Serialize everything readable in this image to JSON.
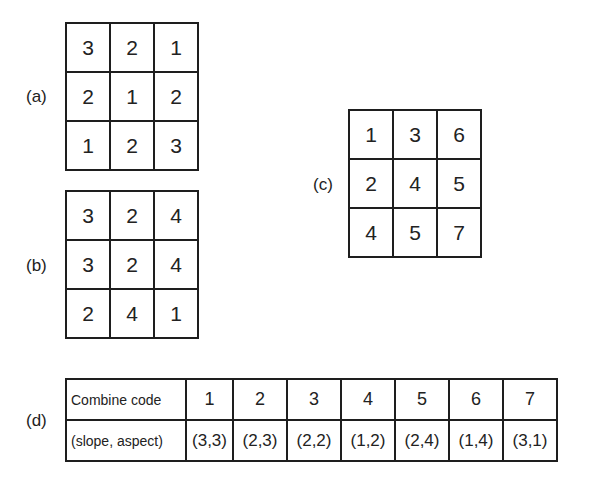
{
  "panels": {
    "a": {
      "label": "(a)",
      "rows": [
        [
          "3",
          "2",
          "1"
        ],
        [
          "2",
          "1",
          "2"
        ],
        [
          "1",
          "2",
          "3"
        ]
      ]
    },
    "b": {
      "label": "(b)",
      "rows": [
        [
          "3",
          "2",
          "4"
        ],
        [
          "3",
          "2",
          "4"
        ],
        [
          "2",
          "4",
          "1"
        ]
      ]
    },
    "c": {
      "label": "(c)",
      "rows": [
        [
          "1",
          "3",
          "6"
        ],
        [
          "2",
          "4",
          "5"
        ],
        [
          "4",
          "5",
          "7"
        ]
      ]
    },
    "d": {
      "label": "(d)",
      "row_headers": [
        "Combine code",
        "(slope, aspect)"
      ],
      "codes": [
        "1",
        "2",
        "3",
        "4",
        "5",
        "6",
        "7"
      ],
      "pairs": [
        "(3,3)",
        "(2,3)",
        "(2,2)",
        "(1,2)",
        "(2,4)",
        "(1,4)",
        "(3,1)"
      ]
    }
  },
  "colors": {
    "line": "#1e1e1e",
    "text": "#222222",
    "background": "#ffffff"
  }
}
